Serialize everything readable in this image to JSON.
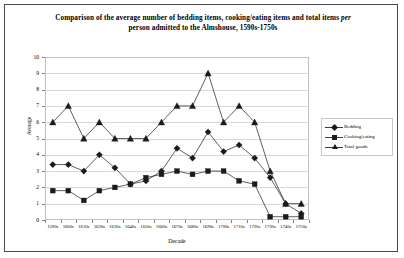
{
  "chart_data": {
    "type": "line",
    "title": "Comparison of the average number of bedding items, cooking/eating items and total items per person admitted to the Almshouse, 1590s-1750s",
    "title_line1": "Comparison of the average number of bedding items, cooking/eating items and total items ",
    "title_line1_italic": "per",
    "title_line2": "person admitted to the Almshouse, 1590s-1750s",
    "xlabel": "Decade",
    "ylabel": "Average",
    "ylim": [
      0,
      10
    ],
    "yticks": [
      0,
      1,
      2,
      3,
      4,
      5,
      6,
      7,
      8,
      9,
      10
    ],
    "grid": true,
    "legend_position": "right",
    "categories": [
      "1590s",
      "1600s",
      "1610s",
      "1620s",
      "1630s",
      "1640s",
      "1650s",
      "1660s",
      "1670s",
      "1680s",
      "1690s",
      "1700s",
      "1710s",
      "1720s",
      "1730s",
      "1740s",
      "1750s"
    ],
    "series": [
      {
        "name": "Bedding",
        "marker": "diamond",
        "color": "#1a1a1a",
        "values": [
          3.4,
          3.4,
          3.0,
          4.0,
          3.2,
          2.2,
          2.4,
          3.0,
          4.4,
          3.8,
          5.4,
          4.2,
          4.6,
          3.8,
          2.6,
          1.0,
          0.4
        ]
      },
      {
        "name": "Cooking/eating",
        "marker": "square",
        "color": "#1a1a1a",
        "values": [
          1.8,
          1.8,
          1.2,
          1.8,
          2.0,
          2.2,
          2.6,
          2.8,
          3.0,
          2.8,
          3.0,
          3.0,
          2.4,
          2.2,
          0.2,
          0.2,
          0.2
        ]
      },
      {
        "name": "Total goods",
        "marker": "triangle",
        "color": "#1a1a1a",
        "values": [
          6.0,
          7.0,
          5.0,
          6.0,
          5.0,
          5.0,
          5.0,
          6.0,
          7.0,
          7.0,
          9.0,
          6.0,
          7.0,
          6.0,
          3.0,
          1.0,
          1.0
        ]
      }
    ]
  },
  "legend": {
    "items": [
      {
        "label": "Bedding",
        "marker": "diamond"
      },
      {
        "label": "Cooking/eating",
        "marker": "square"
      },
      {
        "label": "Total goods",
        "marker": "triangle"
      }
    ]
  },
  "colors": {
    "frame": "#4a4a4a",
    "gridline": "#d9d9d9",
    "axis": "#b8b8b8",
    "series": "#1a1a1a"
  }
}
